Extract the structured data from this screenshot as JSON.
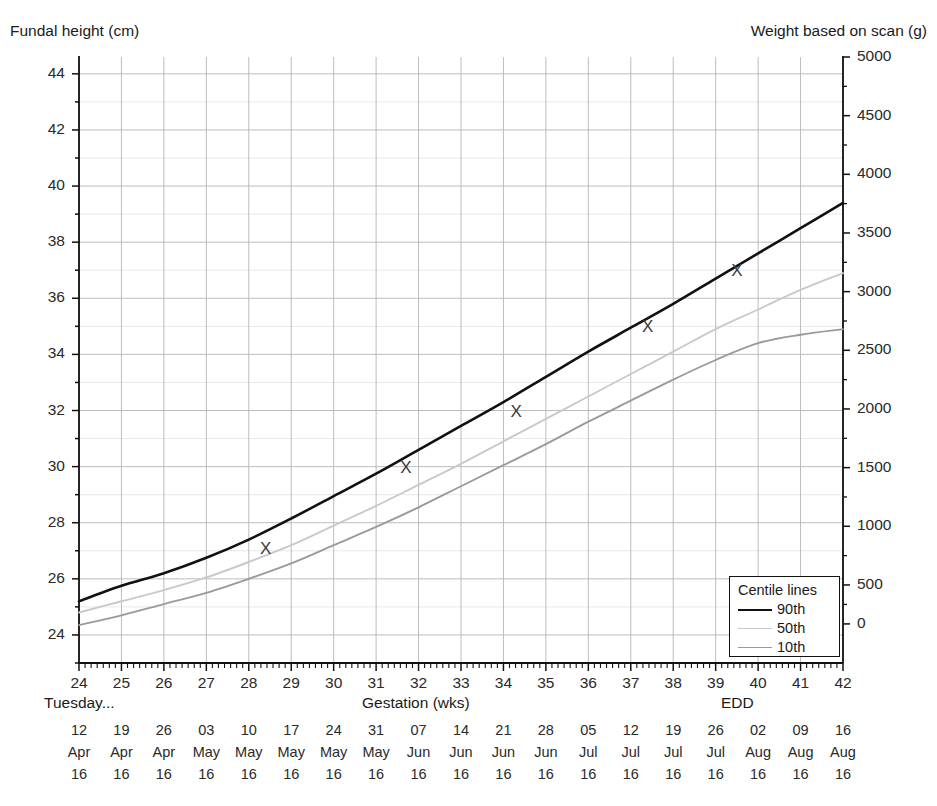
{
  "chart_data": {
    "type": "line",
    "title": "",
    "ylabel_left": "Fundal height (cm)",
    "ylabel_right": "Weight based on scan (g)",
    "xlabel": "Gestation (wks)",
    "xlim": [
      24,
      42
    ],
    "ylim_left": [
      23,
      44.6
    ],
    "ylim_right": [
      0,
      5000
    ],
    "grid": true,
    "legend_position": "bottom-right",
    "legend_title": "Centile lines",
    "x_tick_labels": [
      "24",
      "25",
      "26",
      "27",
      "28",
      "29",
      "30",
      "31",
      "32",
      "33",
      "34",
      "35",
      "36",
      "37",
      "38",
      "39",
      "40",
      "41",
      "42"
    ],
    "y_tick_labels_left": [
      "44",
      "42",
      "40",
      "38",
      "36",
      "34",
      "32",
      "30",
      "28",
      "26",
      "24"
    ],
    "y_tick_values_left": [
      44,
      42,
      40,
      38,
      36,
      34,
      32,
      30,
      28,
      26,
      24
    ],
    "y_tick_labels_right": [
      "5000",
      "4500",
      "4000",
      "3500",
      "3000",
      "2500",
      "2000",
      "1500",
      "1000",
      "500",
      "0"
    ],
    "y_tick_values_right": [
      5000,
      4500,
      4000,
      3500,
      3000,
      2500,
      2000,
      1500,
      1000,
      500,
      0
    ],
    "right_axis_pixel_fracs": [
      0.0,
      0.0968,
      0.1936,
      0.2904,
      0.3872,
      0.484,
      0.5808,
      0.6776,
      0.7744,
      0.8712,
      0.9355
    ],
    "series": [
      {
        "name": "90th",
        "color": "#111111",
        "width": 2.6,
        "x": [
          24,
          25,
          26,
          27,
          28,
          29,
          30,
          31,
          32,
          33,
          34,
          35,
          36,
          37,
          38,
          39,
          40,
          41,
          42
        ],
        "values": [
          25.2,
          25.75,
          26.2,
          26.75,
          27.4,
          28.15,
          28.95,
          29.75,
          30.6,
          31.45,
          32.3,
          33.2,
          34.1,
          34.95,
          35.8,
          36.7,
          37.6,
          38.5,
          39.4
        ]
      },
      {
        "name": "50th",
        "color": "#c9c9c9",
        "width": 1.9,
        "x": [
          24,
          25,
          26,
          27,
          28,
          29,
          30,
          31,
          32,
          33,
          34,
          35,
          36,
          37,
          38,
          39,
          40,
          41,
          42
        ],
        "values": [
          24.8,
          25.2,
          25.6,
          26.05,
          26.6,
          27.2,
          27.9,
          28.6,
          29.35,
          30.1,
          30.9,
          31.7,
          32.5,
          33.3,
          34.1,
          34.9,
          35.6,
          36.3,
          36.9
        ]
      },
      {
        "name": "10th",
        "color": "#9a9a9a",
        "width": 1.9,
        "x": [
          24,
          25,
          26,
          27,
          28,
          29,
          30,
          31,
          32,
          33,
          34,
          35,
          36,
          37,
          38,
          39,
          40,
          41,
          42
        ],
        "values": [
          24.35,
          24.7,
          25.1,
          25.5,
          26.0,
          26.55,
          27.2,
          27.85,
          28.55,
          29.3,
          30.05,
          30.8,
          31.6,
          32.35,
          33.1,
          33.8,
          34.4,
          34.7,
          34.9
        ]
      }
    ],
    "measurements": {
      "name": "Fundal height measurements",
      "marker": "X",
      "color": "#3a3a3a",
      "points": [
        {
          "x": 28.4,
          "y": 27.1
        },
        {
          "x": 31.7,
          "y": 30.0
        },
        {
          "x": 34.3,
          "y": 32.0
        },
        {
          "x": 37.4,
          "y": 35.0
        },
        {
          "x": 39.5,
          "y": 37.0
        }
      ]
    },
    "annotations": {
      "weekday_prefix": "Tuesday...",
      "edd_marker": "EDD",
      "edd_week": 40
    },
    "x_date_rows": [
      {
        "day": "12",
        "month": "Apr",
        "year": "16"
      },
      {
        "day": "19",
        "month": "Apr",
        "year": "16"
      },
      {
        "day": "26",
        "month": "Apr",
        "year": "16"
      },
      {
        "day": "03",
        "month": "May",
        "year": "16"
      },
      {
        "day": "10",
        "month": "May",
        "year": "16"
      },
      {
        "day": "17",
        "month": "May",
        "year": "16"
      },
      {
        "day": "24",
        "month": "May",
        "year": "16"
      },
      {
        "day": "31",
        "month": "May",
        "year": "16"
      },
      {
        "day": "07",
        "month": "Jun",
        "year": "16"
      },
      {
        "day": "14",
        "month": "Jun",
        "year": "16"
      },
      {
        "day": "21",
        "month": "Jun",
        "year": "16"
      },
      {
        "day": "28",
        "month": "Jun",
        "year": "16"
      },
      {
        "day": "05",
        "month": "Jul",
        "year": "16"
      },
      {
        "day": "12",
        "month": "Jul",
        "year": "16"
      },
      {
        "day": "19",
        "month": "Jul",
        "year": "16"
      },
      {
        "day": "26",
        "month": "Jul",
        "year": "16"
      },
      {
        "day": "02",
        "month": "Aug",
        "year": "16"
      },
      {
        "day": "09",
        "month": "Aug",
        "year": "16"
      },
      {
        "day": "16",
        "month": "Aug",
        "year": "16"
      }
    ]
  },
  "legend": {
    "title": "Centile lines",
    "entries": [
      {
        "label": "90th",
        "color": "#111111",
        "width": "2.6px"
      },
      {
        "label": "50th",
        "color": "#c9c9c9",
        "width": "1.6px"
      },
      {
        "label": "10th",
        "color": "#9a9a9a",
        "width": "1.6px"
      }
    ]
  },
  "plot_geometry": {
    "left": 79,
    "right": 843,
    "top": 57,
    "bottom": 663
  },
  "colors": {
    "grid_major": "#b5b5b5",
    "grid_minor": "#e2e2e2",
    "axis": "#111111",
    "text": "#1a1a1a"
  }
}
